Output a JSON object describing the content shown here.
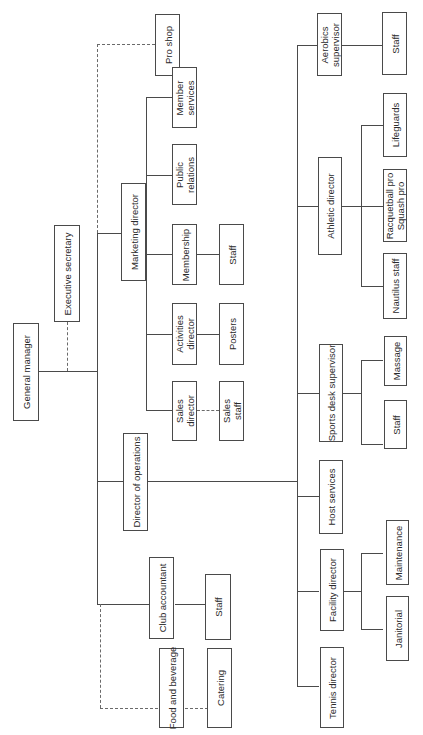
{
  "diagram": {
    "type": "org-chart",
    "orientation": "rotated-90-ccw",
    "nodes": {
      "general_manager": "General manager",
      "executive_secretary": "Executive secretary",
      "pro_shop": "Pro shop",
      "marketing_director": "Marketing director",
      "member_services": [
        "Member",
        "services"
      ],
      "public_relations": [
        "Public",
        "relations"
      ],
      "membership": "Membership",
      "membership_staff": "Staff",
      "activities_director": [
        "Activities",
        "director"
      ],
      "posters": "Posters",
      "sales_director": [
        "Sales",
        "director"
      ],
      "sales_staff": [
        "Sales",
        "staff"
      ],
      "director_of_operations": "Director of operations",
      "club_accountant": "Club accountant",
      "accountant_staff": "Staff",
      "food_and_beverage": "Food and beverage",
      "catering": "Catering",
      "aerobics_supervisor": [
        "Aerobics",
        "supervisor"
      ],
      "aerobics_staff": "Staff",
      "athletic_director": "Athletic director",
      "lifeguards": "Lifeguards",
      "racquetball_squash_pro": [
        "Racquetball pro",
        "Squash pro"
      ],
      "nautilus_staff": "Nautilus staff",
      "sports_desk_supervisor": "Sports desk supervisor",
      "massage": "Massage",
      "sports_desk_staff": "Staff",
      "host_services": "Host services",
      "facility_director": "Facility director",
      "maintenance": "Maintenance",
      "janitorial": "Janitorial",
      "tennis_director": "Tennis director"
    },
    "edges": [
      {
        "from": "general_manager",
        "to": "executive_secretary",
        "style": "dashed"
      },
      {
        "from": "general_manager",
        "to": "pro_shop",
        "style": "dashed"
      },
      {
        "from": "general_manager",
        "to": "marketing_director",
        "style": "solid"
      },
      {
        "from": "general_manager",
        "to": "director_of_operations",
        "style": "solid"
      },
      {
        "from": "general_manager",
        "to": "club_accountant",
        "style": "solid"
      },
      {
        "from": "general_manager",
        "to": "food_and_beverage",
        "style": "dashed"
      },
      {
        "from": "marketing_director",
        "to": "member_services",
        "style": "solid"
      },
      {
        "from": "marketing_director",
        "to": "public_relations",
        "style": "solid"
      },
      {
        "from": "marketing_director",
        "to": "membership",
        "style": "solid"
      },
      {
        "from": "marketing_director",
        "to": "activities_director",
        "style": "solid"
      },
      {
        "from": "marketing_director",
        "to": "sales_director",
        "style": "solid"
      },
      {
        "from": "membership",
        "to": "membership_staff",
        "style": "solid"
      },
      {
        "from": "activities_director",
        "to": "posters",
        "style": "solid"
      },
      {
        "from": "sales_director",
        "to": "sales_staff",
        "style": "dashed"
      },
      {
        "from": "club_accountant",
        "to": "accountant_staff",
        "style": "solid"
      },
      {
        "from": "food_and_beverage",
        "to": "catering",
        "style": "dashed"
      },
      {
        "from": "director_of_operations",
        "to": "aerobics_supervisor",
        "style": "solid"
      },
      {
        "from": "director_of_operations",
        "to": "athletic_director",
        "style": "solid"
      },
      {
        "from": "director_of_operations",
        "to": "sports_desk_supervisor",
        "style": "solid"
      },
      {
        "from": "director_of_operations",
        "to": "host_services",
        "style": "solid"
      },
      {
        "from": "director_of_operations",
        "to": "facility_director",
        "style": "solid"
      },
      {
        "from": "director_of_operations",
        "to": "tennis_director",
        "style": "solid"
      },
      {
        "from": "aerobics_supervisor",
        "to": "aerobics_staff",
        "style": "solid"
      },
      {
        "from": "athletic_director",
        "to": "lifeguards",
        "style": "solid"
      },
      {
        "from": "athletic_director",
        "to": "racquetball_squash_pro",
        "style": "solid"
      },
      {
        "from": "athletic_director",
        "to": "nautilus_staff",
        "style": "solid"
      },
      {
        "from": "sports_desk_supervisor",
        "to": "massage",
        "style": "solid"
      },
      {
        "from": "sports_desk_supervisor",
        "to": "sports_desk_staff",
        "style": "solid"
      },
      {
        "from": "facility_director",
        "to": "maintenance",
        "style": "solid"
      },
      {
        "from": "facility_director",
        "to": "janitorial",
        "style": "solid"
      }
    ]
  }
}
